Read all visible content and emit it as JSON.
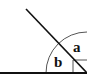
{
  "diagram": {
    "type": "angle-diagram",
    "labels": {
      "angle_a": "a",
      "angle_b": "b"
    },
    "colors": {
      "stroke": "#111111",
      "arc": "#555555",
      "background": "#ffffff"
    },
    "geometry": {
      "vertex": [
        87,
        73
      ],
      "baseline": {
        "from": [
          0,
          73
        ],
        "to": [
          87,
          73
        ]
      },
      "diagonal": {
        "from": [
          26,
          9
        ],
        "to": [
          87,
          73
        ]
      },
      "arc_radius": 41,
      "marker_box": {
        "x": 73,
        "y": 60
      }
    }
  }
}
